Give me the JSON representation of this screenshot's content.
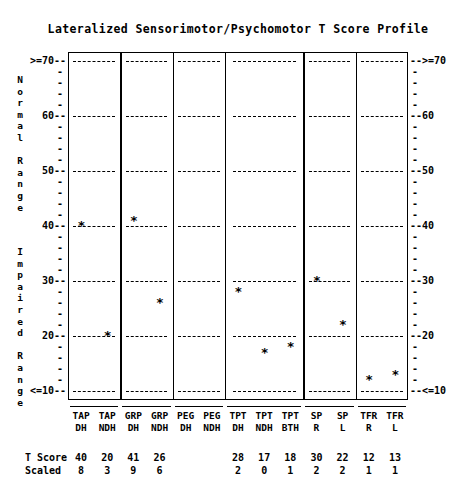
{
  "title": "Lateralized Sensorimotor/Psychomotor T Score Profile",
  "axis": {
    "left_label_top": "Normal Range",
    "left_label_bottom": "Impaired Range",
    "top_tick": ">=70",
    "bottom_tick": "<=10",
    "major_ticks": [
      ">=70",
      "60",
      "50",
      "40",
      "30",
      "20",
      "<=10"
    ],
    "major_values": [
      70,
      60,
      50,
      40,
      30,
      20,
      10
    ],
    "minor_dash": "-",
    "tick_lead": "--",
    "ymin": 10,
    "ymax": 70
  },
  "rows": {
    "t_score_label": "T Score",
    "scaled_label": "Scaled"
  },
  "columns": [
    {
      "top": "TAP",
      "bottom": "DH",
      "t_score": "40",
      "scaled": "8",
      "value": 40,
      "group": 0
    },
    {
      "top": "TAP",
      "bottom": "NDH",
      "t_score": "20",
      "scaled": "3",
      "value": 20,
      "group": 0
    },
    {
      "top": "GRP",
      "bottom": "DH",
      "t_score": "41",
      "scaled": "9",
      "value": 41,
      "group": 1
    },
    {
      "top": "GRP",
      "bottom": "NDH",
      "t_score": "26",
      "scaled": "6",
      "value": 26,
      "group": 1
    },
    {
      "top": "PEG",
      "bottom": "DH",
      "t_score": "",
      "scaled": "",
      "value": null,
      "group": 2
    },
    {
      "top": "PEG",
      "bottom": "NDH",
      "t_score": "",
      "scaled": "",
      "value": null,
      "group": 2
    },
    {
      "top": "TPT",
      "bottom": "DH",
      "t_score": "28",
      "scaled": "2",
      "value": 28,
      "group": 3
    },
    {
      "top": "TPT",
      "bottom": "NDH",
      "t_score": "17",
      "scaled": "0",
      "value": 17,
      "group": 3
    },
    {
      "top": "TPT",
      "bottom": "BTH",
      "t_score": "18",
      "scaled": "1",
      "value": 18,
      "group": 3
    },
    {
      "top": "SP",
      "bottom": "R",
      "t_score": "30",
      "scaled": "2",
      "value": 30,
      "group": 4
    },
    {
      "top": "SP",
      "bottom": "L",
      "t_score": "22",
      "scaled": "2",
      "value": 22,
      "group": 4
    },
    {
      "top": "TFR",
      "bottom": "R",
      "t_score": "12",
      "scaled": "1",
      "value": 12,
      "group": 5
    },
    {
      "top": "TFR",
      "bottom": "L",
      "t_score": "13",
      "scaled": "1",
      "value": 13,
      "group": 5
    }
  ],
  "marker_glyph": "*",
  "chart_data": {
    "type": "scatter",
    "title": "Lateralized Sensorimotor/Psychomotor T Score Profile",
    "xlabel": "",
    "ylabel": "T Score",
    "ylim": [
      10,
      70
    ],
    "grid": true,
    "legend": false,
    "categories": [
      "TAP DH",
      "TAP NDH",
      "GRP DH",
      "GRP NDH",
      "PEG DH",
      "PEG NDH",
      "TPT DH",
      "TPT NDH",
      "TPT BTH",
      "SP R",
      "SP L",
      "TFR R",
      "TFR L"
    ],
    "series": [
      {
        "name": "T Score",
        "values": [
          40,
          20,
          41,
          26,
          null,
          null,
          28,
          17,
          18,
          30,
          22,
          12,
          13
        ]
      },
      {
        "name": "Scaled",
        "values": [
          8,
          3,
          9,
          6,
          null,
          null,
          2,
          0,
          1,
          2,
          2,
          1,
          1
        ]
      }
    ],
    "annotations": {
      "normal_range": "Normal Range (T 40-70)",
      "impaired_range": "Impaired Range (T 10-40)"
    }
  }
}
